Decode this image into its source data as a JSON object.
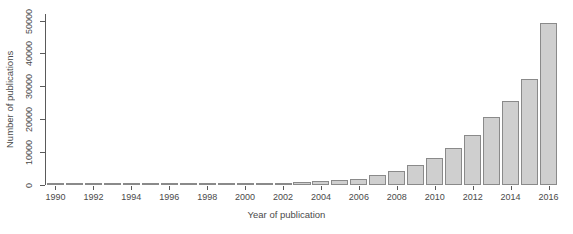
{
  "chart_data": {
    "type": "bar",
    "title": "",
    "xlabel": "Year of publication",
    "ylabel": "Number of publications",
    "categories": [
      "1990",
      "1991",
      "1992",
      "1993",
      "1994",
      "1995",
      "1996",
      "1997",
      "1998",
      "1999",
      "2000",
      "2001",
      "2002",
      "2003",
      "2004",
      "2005",
      "2006",
      "2007",
      "2008",
      "2009",
      "2010",
      "2011",
      "2012",
      "2013",
      "2014",
      "2015",
      "2016"
    ],
    "values": [
      120,
      140,
      170,
      200,
      230,
      260,
      300,
      340,
      380,
      430,
      500,
      600,
      750,
      950,
      1200,
      1500,
      1900,
      2900,
      4300,
      6000,
      8100,
      11200,
      15200,
      20800,
      25400,
      32200,
      41200
    ],
    "values_2016_tall": 49300,
    "ylim": [
      0,
      52000
    ],
    "y_ticks": [
      0,
      10000,
      20000,
      30000,
      40000,
      50000
    ],
    "y_tick_labels": [
      "0",
      "10000",
      "20000",
      "30000",
      "40000",
      "50000"
    ],
    "x_tick_labels": [
      "1990",
      "1992",
      "1994",
      "1996",
      "1998",
      "2000",
      "2002",
      "2004",
      "2006",
      "2008",
      "2010",
      "2012",
      "2014",
      "2016"
    ],
    "x_tick_years": [
      1990,
      1992,
      1994,
      1996,
      1998,
      2000,
      2002,
      2004,
      2006,
      2008,
      2010,
      2012,
      2014,
      2016
    ],
    "grid": false,
    "legend": "none",
    "bar_fill_color": "#cfcfcf",
    "bar_border_color": "#8a8a8a",
    "axis_color": "#5a5a5a",
    "text_color": "#4a4a4a",
    "background_color": "#ffffff"
  }
}
